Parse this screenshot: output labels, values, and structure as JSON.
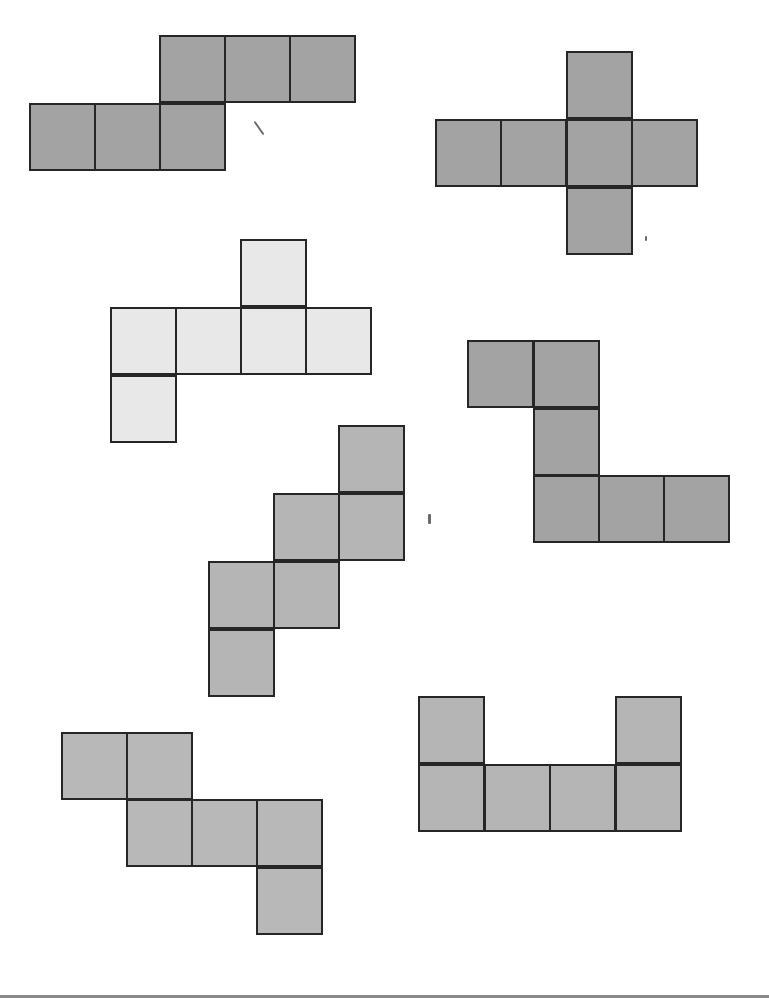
{
  "diagram": {
    "title": "",
    "cell_size": 66,
    "nets": [
      {
        "id": "net-1",
        "fill": "#a3a3a3",
        "cells": [
          [
            159,
            35
          ],
          [
            224,
            35
          ],
          [
            289,
            35
          ],
          [
            29,
            103
          ],
          [
            94,
            103
          ],
          [
            159,
            103
          ]
        ]
      },
      {
        "id": "net-2",
        "fill": "#a3a3a3",
        "cells": [
          [
            566,
            51
          ],
          [
            435,
            119
          ],
          [
            500,
            119
          ],
          [
            566,
            119
          ],
          [
            631,
            119
          ],
          [
            566,
            187
          ]
        ]
      },
      {
        "id": "net-3",
        "fill": "#e8e8e8",
        "cells": [
          [
            240,
            239
          ],
          [
            110,
            307
          ],
          [
            175,
            307
          ],
          [
            240,
            307
          ],
          [
            305,
            307
          ],
          [
            110,
            375
          ]
        ]
      },
      {
        "id": "net-4",
        "fill": "#a3a3a3",
        "cells": [
          [
            467,
            340
          ],
          [
            533,
            340
          ],
          [
            533,
            408
          ],
          [
            533,
            475
          ],
          [
            598,
            475
          ],
          [
            663,
            475
          ]
        ]
      },
      {
        "id": "net-5",
        "fill": "#b5b5b5",
        "cells": [
          [
            338,
            425
          ],
          [
            273,
            493
          ],
          [
            338,
            493
          ],
          [
            208,
            561
          ],
          [
            273,
            561
          ],
          [
            208,
            629
          ]
        ]
      },
      {
        "id": "net-6",
        "fill": "#b8b8b8",
        "cells": [
          [
            61,
            732
          ],
          [
            126,
            732
          ],
          [
            126,
            799
          ],
          [
            191,
            799
          ],
          [
            256,
            799
          ],
          [
            256,
            867
          ]
        ]
      },
      {
        "id": "net-7",
        "fill": "#b5b5b5",
        "cells": [
          [
            418,
            696
          ],
          [
            615,
            696
          ],
          [
            418,
            764
          ],
          [
            484,
            764
          ],
          [
            549,
            764
          ],
          [
            615,
            764
          ]
        ]
      }
    ],
    "stray_marks": [
      {
        "x": 258,
        "y": 120,
        "w": 2,
        "h": 16,
        "rotate": -35
      },
      {
        "x": 428,
        "y": 514,
        "w": 3,
        "h": 10,
        "rotate": 0
      },
      {
        "x": 645,
        "y": 236,
        "w": 2,
        "h": 5,
        "rotate": 0
      }
    ],
    "bottom_rule_color": "#8a8a8a"
  }
}
